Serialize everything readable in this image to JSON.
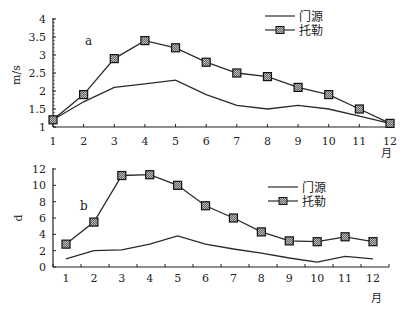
{
  "chart_data": [
    {
      "type": "line",
      "panel": "a",
      "title": "",
      "xlabel": "月",
      "ylabel": "m/s",
      "categories": [
        "1",
        "2",
        "3",
        "4",
        "5",
        "6",
        "7",
        "8",
        "9",
        "10",
        "11",
        "12"
      ],
      "ylim": [
        1,
        4
      ],
      "yticks": [
        "1",
        "1.5",
        "2",
        "2.5",
        "3",
        "3.5",
        "4"
      ],
      "grid": false,
      "legend_position": "top-right",
      "series": [
        {
          "name": "门源",
          "marker": "none",
          "values": [
            1.2,
            1.7,
            2.1,
            2.2,
            2.3,
            1.9,
            1.6,
            1.5,
            1.6,
            1.5,
            1.3,
            1.1
          ]
        },
        {
          "name": "托勒",
          "marker": "square",
          "values": [
            1.2,
            1.9,
            2.9,
            3.4,
            3.2,
            2.8,
            2.5,
            2.4,
            2.1,
            1.9,
            1.5,
            1.1
          ]
        }
      ]
    },
    {
      "type": "line",
      "panel": "b",
      "title": "",
      "xlabel": "月",
      "ylabel": "d",
      "categories": [
        "1",
        "2",
        "3",
        "4",
        "5",
        "6",
        "7",
        "8",
        "9",
        "10",
        "11",
        "12"
      ],
      "ylim": [
        0,
        12
      ],
      "yticks": [
        "0",
        "2",
        "4",
        "6",
        "8",
        "10",
        "12"
      ],
      "grid": false,
      "legend_position": "right",
      "series": [
        {
          "name": "门源",
          "marker": "none",
          "values": [
            1.0,
            2.0,
            2.1,
            2.8,
            3.8,
            2.8,
            2.2,
            1.7,
            1.1,
            0.6,
            1.3,
            1.0
          ]
        },
        {
          "name": "托勒",
          "marker": "square",
          "values": [
            2.8,
            5.5,
            11.2,
            11.3,
            10.0,
            7.5,
            6.0,
            4.3,
            3.2,
            3.1,
            3.7,
            3.1
          ]
        }
      ]
    }
  ],
  "colors": {
    "line": "#2a2a2a",
    "marker_fill": "#555555",
    "axis": "#222222"
  }
}
